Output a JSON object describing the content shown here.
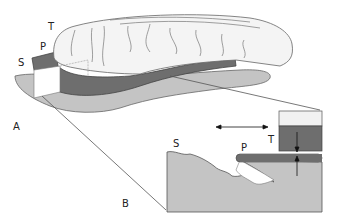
{
  "figure": {
    "panel_a": {
      "label": "A",
      "layer_labels": {
        "tissue": "T",
        "plate": "P",
        "substrate": "S"
      }
    },
    "panel_b": {
      "label": "B",
      "layer_labels": {
        "tissue": "T",
        "plate": "P",
        "substrate": "S"
      },
      "arrows": [
        "horizontal-double-arrow",
        "vertical-arrow-down",
        "vertical-arrow-up"
      ]
    },
    "colors": {
      "tissue_fill": "#f2f2f2",
      "plate_fill": "#6e6e6e",
      "substrate_fill": "#c4c4c4",
      "outline": "#555555",
      "background": "#ffffff"
    }
  }
}
